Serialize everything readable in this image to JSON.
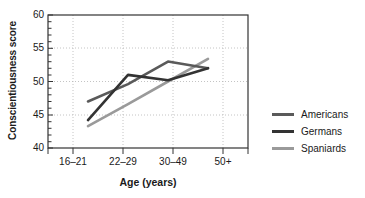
{
  "chart_data": {
    "type": "line",
    "title": "",
    "xlabel": "Age (years)",
    "ylabel": "Conscientiousness score",
    "categories": [
      "16–21",
      "22–29",
      "30–49",
      "50+"
    ],
    "ylim": [
      40,
      60
    ],
    "yticks": [
      40,
      45,
      50,
      55,
      60
    ],
    "ytick_labels": [
      "40",
      "45",
      "50",
      "55",
      "60"
    ],
    "grid": true,
    "grid_style": "dotted-vertical-and-horizontal",
    "legend_position": "right",
    "series": [
      {
        "name": "Americans",
        "color": "#5a5a5a",
        "values": [
          47.0,
          49.6,
          53.0,
          52.0
        ]
      },
      {
        "name": "Germans",
        "color": "#333333",
        "values": [
          44.2,
          51.0,
          50.2,
          52.0
        ]
      },
      {
        "name": "Spaniards",
        "color": "#9a9a9a",
        "values": [
          43.3,
          46.6,
          50.0,
          53.4
        ]
      }
    ]
  },
  "axes": {
    "ylabel": "Conscientiousness score",
    "xlabel": "Age (years)",
    "ytick_labels": [
      "60",
      "55",
      "50",
      "45",
      "40"
    ],
    "xtick_labels": [
      "16–21",
      "22–29",
      "30–49",
      "50+"
    ]
  },
  "legend": {
    "items": [
      {
        "label": "Americans",
        "color": "#5a5a5a"
      },
      {
        "label": "Germans",
        "color": "#333333"
      },
      {
        "label": "Spaniards",
        "color": "#9a9a9a"
      }
    ]
  },
  "colors": {
    "axis": "#333333",
    "grid": "#b5b5b5",
    "text": "#1a1a1a",
    "background": "#ffffff"
  }
}
